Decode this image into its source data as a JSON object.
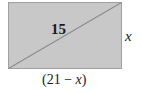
{
  "diagram": {
    "shape": "rectangle",
    "fill_color": "#c8c8c8",
    "stroke_color": "#9a9a9a",
    "diagonal_color": "#8c8c8c",
    "diagonal_label": "15",
    "height_label": "x",
    "width_label_open": "(21 ",
    "width_label_minus": "−",
    "width_label_var": " x",
    "width_label_close": ")"
  }
}
